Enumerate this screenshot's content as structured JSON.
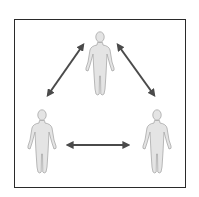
{
  "diagram": {
    "type": "triangle-relationship",
    "nodes": [
      {
        "id": "top",
        "label": "",
        "icon": "person-figure"
      },
      {
        "id": "left",
        "label": "",
        "icon": "person-figure"
      },
      {
        "id": "right",
        "label": "",
        "icon": "person-figure"
      }
    ],
    "edges": [
      {
        "from": "top",
        "to": "left",
        "style": "double-headed-arrow"
      },
      {
        "from": "top",
        "to": "right",
        "style": "double-headed-arrow"
      },
      {
        "from": "left",
        "to": "right",
        "style": "double-headed-arrow"
      }
    ],
    "colors": {
      "figure_fill": "#e4e4e4",
      "figure_stroke": "#a8a8a8",
      "arrow": "#4a4a4a",
      "frame": "#2a2a2a"
    }
  }
}
